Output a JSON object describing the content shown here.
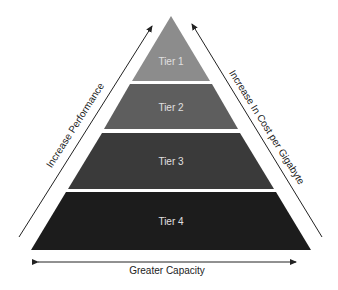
{
  "diagram": {
    "type": "pyramid",
    "tiers": [
      {
        "label": "Tier 1",
        "color": "#8c8c8c"
      },
      {
        "label": "Tier 2",
        "color": "#5e5e5e"
      },
      {
        "label": "Tier 3",
        "color": "#3a3a3a"
      },
      {
        "label": "Tier 4",
        "color": "#1c1c1c"
      }
    ],
    "left_arrow_label": "Increase Performance",
    "right_arrow_label": "Increase In Cost per Gigabyte",
    "bottom_arrow_label": "Greater Capacity"
  }
}
